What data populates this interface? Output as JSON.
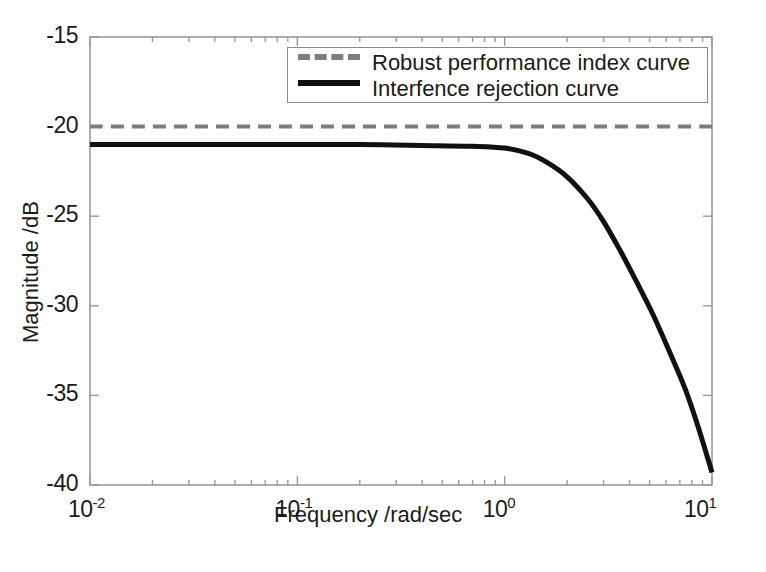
{
  "chart_data": {
    "type": "line",
    "title": "",
    "xlabel": "Frequency /rad/sec",
    "ylabel": "Magnitude /dB",
    "xscale": "log",
    "yscale": "linear",
    "xlim": [
      0.01,
      10
    ],
    "ylim": [
      -40,
      -15
    ],
    "grid": false,
    "legend_position": "top-right-inside",
    "xticks": [
      {
        "value": 0.01,
        "base": "10",
        "exp": "-2"
      },
      {
        "value": 0.1,
        "base": "10",
        "exp": "-1"
      },
      {
        "value": 1,
        "base": "10",
        "exp": "0"
      },
      {
        "value": 10,
        "base": "10",
        "exp": "1"
      }
    ],
    "yticks": [
      "-15",
      "-20",
      "-25",
      "-30",
      "-35",
      "-40"
    ],
    "ytick_values": [
      -15,
      -20,
      -25,
      -30,
      -35,
      -40
    ],
    "series": [
      {
        "name": "Robust performance index curve",
        "style": "dashed",
        "color": "#7d7d7d",
        "linewidth": 4,
        "x": [
          0.01,
          0.0316,
          0.1,
          0.316,
          1,
          3.16,
          10
        ],
        "values": [
          -20.0,
          -20.0,
          -20.0,
          -20.0,
          -20.0,
          -20.0,
          -20.0
        ]
      },
      {
        "name": "Interfence rejection curve",
        "style": "solid",
        "color": "#111111",
        "linewidth": 5,
        "x": [
          0.01,
          0.02,
          0.05,
          0.1,
          0.2,
          0.4,
          0.7,
          1.0,
          1.3,
          1.6,
          2.0,
          2.5,
          3.0,
          3.6,
          4.3,
          5.2,
          6.2,
          7.4,
          8.6,
          10.0
        ],
        "values": [
          -21.0,
          -21.0,
          -21.0,
          -21.0,
          -21.0,
          -21.05,
          -21.1,
          -21.2,
          -21.5,
          -22.0,
          -22.8,
          -24.0,
          -25.3,
          -26.9,
          -28.6,
          -30.5,
          -32.5,
          -34.6,
          -36.8,
          -39.3
        ]
      }
    ],
    "legend": [
      {
        "label": "Robust performance index curve",
        "style": "dashed",
        "color": "#7d7d7d"
      },
      {
        "label": "Interfence rejection curve",
        "style": "solid",
        "color": "#111111"
      }
    ]
  },
  "axes": {
    "frame_color": "#9a9a9a",
    "background": "#ffffff"
  }
}
